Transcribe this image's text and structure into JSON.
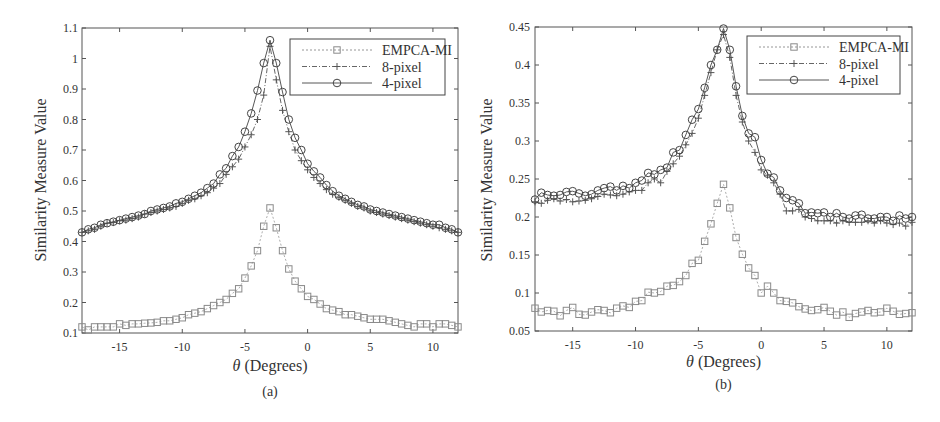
{
  "figure": {
    "panels": [
      "(a)",
      "(b)"
    ]
  },
  "chart_data": [
    {
      "type": "line",
      "panel_label": "(a)",
      "title": "",
      "xlabel": "θ (Degrees)",
      "ylabel": "Similarity Measure Value",
      "xlim": [
        -18,
        12
      ],
      "ylim": [
        0.1,
        1.1
      ],
      "xticks": [
        -15,
        -10,
        -5,
        0,
        5,
        10
      ],
      "xtick_labels": [
        "-15",
        "-10",
        "-5",
        "0",
        "5",
        "10"
      ],
      "yticks": [
        0.1,
        0.2,
        0.3,
        0.4,
        0.5,
        0.6,
        0.7,
        0.8,
        0.9,
        1.0,
        1.1
      ],
      "ytick_labels": [
        "0.1",
        "0.2",
        "0.3",
        "0.4",
        "0.5",
        "0.6",
        "0.7",
        "0.8",
        "0.9",
        "1",
        "1.1"
      ],
      "grid": false,
      "legend_position": "upper right",
      "x": [
        -18,
        -17.5,
        -17,
        -16.5,
        -16,
        -15.5,
        -15,
        -14.5,
        -14,
        -13.5,
        -13,
        -12.5,
        -12,
        -11.5,
        -11,
        -10.5,
        -10,
        -9.5,
        -9,
        -8.5,
        -8,
        -7.5,
        -7,
        -6.5,
        -6,
        -5.5,
        -5,
        -4.5,
        -4,
        -3.5,
        -3,
        -2.5,
        -2,
        -1.5,
        -1,
        -0.5,
        0,
        0.5,
        1,
        1.5,
        2,
        2.5,
        3,
        3.5,
        4,
        4.5,
        5,
        5.5,
        6,
        6.5,
        7,
        7.5,
        8,
        8.5,
        9,
        9.5,
        10,
        10.5,
        11,
        11.5,
        12
      ],
      "series": [
        {
          "name": "EMPCA-MI",
          "marker": "square",
          "line": "dotted",
          "values": [
            0.12,
            0.11,
            0.12,
            0.12,
            0.12,
            0.12,
            0.13,
            0.125,
            0.13,
            0.13,
            0.132,
            0.133,
            0.135,
            0.14,
            0.14,
            0.145,
            0.15,
            0.16,
            0.165,
            0.17,
            0.18,
            0.19,
            0.2,
            0.21,
            0.23,
            0.245,
            0.28,
            0.32,
            0.37,
            0.45,
            0.51,
            0.445,
            0.37,
            0.31,
            0.27,
            0.245,
            0.22,
            0.21,
            0.195,
            0.18,
            0.175,
            0.17,
            0.16,
            0.16,
            0.155,
            0.15,
            0.145,
            0.145,
            0.145,
            0.14,
            0.135,
            0.13,
            0.125,
            0.12,
            0.13,
            0.13,
            0.12,
            0.13,
            0.13,
            0.125,
            0.12
          ]
        },
        {
          "name": "8-pixel",
          "marker": "plus",
          "line": "dashdot",
          "values": [
            0.43,
            0.435,
            0.44,
            0.45,
            0.46,
            0.462,
            0.468,
            0.47,
            0.475,
            0.48,
            0.49,
            0.495,
            0.5,
            0.505,
            0.51,
            0.515,
            0.525,
            0.535,
            0.54,
            0.55,
            0.56,
            0.575,
            0.59,
            0.62,
            0.645,
            0.67,
            0.71,
            0.75,
            0.8,
            0.88,
            1.04,
            0.93,
            0.83,
            0.76,
            0.7,
            0.665,
            0.635,
            0.61,
            0.59,
            0.57,
            0.555,
            0.545,
            0.535,
            0.525,
            0.515,
            0.51,
            0.5,
            0.495,
            0.49,
            0.485,
            0.48,
            0.475,
            0.47,
            0.465,
            0.46,
            0.455,
            0.45,
            0.445,
            0.44,
            0.435,
            0.43
          ]
        },
        {
          "name": "4-pixel",
          "marker": "circle",
          "line": "solid",
          "values": [
            0.43,
            0.44,
            0.445,
            0.455,
            0.46,
            0.465,
            0.47,
            0.475,
            0.48,
            0.485,
            0.49,
            0.5,
            0.505,
            0.51,
            0.515,
            0.525,
            0.53,
            0.54,
            0.55,
            0.56,
            0.575,
            0.59,
            0.62,
            0.64,
            0.68,
            0.71,
            0.76,
            0.82,
            0.895,
            0.985,
            1.06,
            0.985,
            0.89,
            0.8,
            0.74,
            0.7,
            0.655,
            0.63,
            0.61,
            0.585,
            0.565,
            0.55,
            0.54,
            0.53,
            0.52,
            0.515,
            0.505,
            0.5,
            0.495,
            0.49,
            0.485,
            0.48,
            0.475,
            0.47,
            0.465,
            0.46,
            0.455,
            0.455,
            0.445,
            0.44,
            0.43
          ]
        }
      ]
    },
    {
      "type": "line",
      "panel_label": "(b)",
      "title": "",
      "xlabel": "θ (Degrees)",
      "ylabel": "Similarity Measure Value",
      "xlim": [
        -18,
        12
      ],
      "ylim": [
        0.05,
        0.45
      ],
      "xticks": [
        -15,
        -10,
        -5,
        0,
        5,
        10
      ],
      "xtick_labels": [
        "-15",
        "-10",
        "-5",
        "0",
        "5",
        "10"
      ],
      "yticks": [
        0.05,
        0.1,
        0.15,
        0.2,
        0.25,
        0.3,
        0.35,
        0.4,
        0.45
      ],
      "ytick_labels": [
        "0.05",
        "0.1",
        "0.15",
        "0.2",
        "0.25",
        "0.3",
        "0.35",
        "0.4",
        "0.45"
      ],
      "grid": false,
      "legend_position": "upper right",
      "x": [
        -18,
        -17.5,
        -17,
        -16.5,
        -16,
        -15.5,
        -15,
        -14.5,
        -14,
        -13.5,
        -13,
        -12.5,
        -12,
        -11.5,
        -11,
        -10.5,
        -10,
        -9.5,
        -9,
        -8.5,
        -8,
        -7.5,
        -7,
        -6.5,
        -6,
        -5.5,
        -5,
        -4.5,
        -4,
        -3.5,
        -3,
        -2.5,
        -2,
        -1.5,
        -1,
        -0.5,
        0,
        0.5,
        1,
        1.5,
        2,
        2.5,
        3,
        3.5,
        4,
        4.5,
        5,
        5.5,
        6,
        6.5,
        7,
        7.5,
        8,
        8.5,
        9,
        9.5,
        10,
        10.5,
        11,
        11.5,
        12
      ],
      "series": [
        {
          "name": "EMPCA-MI",
          "marker": "square",
          "line": "dotted",
          "values": [
            0.08,
            0.075,
            0.077,
            0.076,
            0.07,
            0.077,
            0.081,
            0.072,
            0.071,
            0.075,
            0.078,
            0.077,
            0.074,
            0.08,
            0.083,
            0.081,
            0.089,
            0.09,
            0.101,
            0.1,
            0.102,
            0.109,
            0.11,
            0.115,
            0.123,
            0.139,
            0.143,
            0.168,
            0.191,
            0.218,
            0.243,
            0.212,
            0.173,
            0.151,
            0.133,
            0.123,
            0.1,
            0.109,
            0.1,
            0.09,
            0.089,
            0.087,
            0.082,
            0.079,
            0.077,
            0.078,
            0.081,
            0.076,
            0.071,
            0.075,
            0.068,
            0.073,
            0.075,
            0.077,
            0.074,
            0.075,
            0.08,
            0.076,
            0.072,
            0.073,
            0.074
          ]
        },
        {
          "name": "8-pixel",
          "marker": "plus",
          "line": "dashdot",
          "values": [
            0.22,
            0.218,
            0.222,
            0.224,
            0.221,
            0.223,
            0.22,
            0.221,
            0.222,
            0.224,
            0.227,
            0.23,
            0.229,
            0.228,
            0.23,
            0.233,
            0.235,
            0.235,
            0.245,
            0.25,
            0.245,
            0.26,
            0.27,
            0.28,
            0.295,
            0.31,
            0.33,
            0.36,
            0.39,
            0.42,
            0.44,
            0.41,
            0.36,
            0.325,
            0.3,
            0.285,
            0.262,
            0.255,
            0.245,
            0.23,
            0.208,
            0.208,
            0.21,
            0.2,
            0.198,
            0.195,
            0.195,
            0.195,
            0.192,
            0.195,
            0.193,
            0.193,
            0.193,
            0.195,
            0.192,
            0.195,
            0.192,
            0.19,
            0.192,
            0.188,
            0.193
          ]
        },
        {
          "name": "4-pixel",
          "marker": "circle",
          "line": "solid",
          "values": [
            0.223,
            0.232,
            0.229,
            0.228,
            0.229,
            0.233,
            0.234,
            0.231,
            0.228,
            0.23,
            0.235,
            0.238,
            0.24,
            0.235,
            0.241,
            0.238,
            0.245,
            0.248,
            0.258,
            0.256,
            0.262,
            0.265,
            0.285,
            0.288,
            0.308,
            0.328,
            0.342,
            0.37,
            0.4,
            0.42,
            0.448,
            0.42,
            0.372,
            0.333,
            0.31,
            0.305,
            0.275,
            0.257,
            0.252,
            0.235,
            0.225,
            0.222,
            0.218,
            0.205,
            0.206,
            0.205,
            0.206,
            0.2,
            0.205,
            0.2,
            0.198,
            0.202,
            0.203,
            0.198,
            0.198,
            0.2,
            0.2,
            0.195,
            0.202,
            0.198,
            0.2
          ]
        }
      ]
    }
  ]
}
